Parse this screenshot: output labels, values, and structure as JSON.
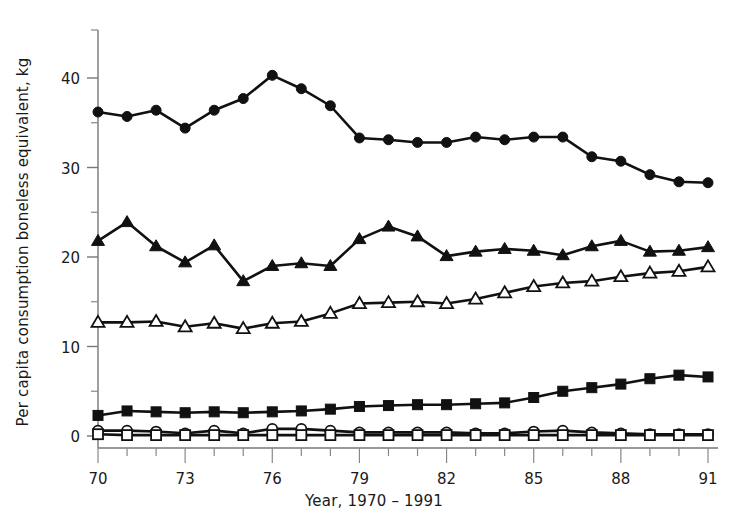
{
  "chart_data": {
    "type": "line",
    "title": "",
    "xlabel": "Year, 1970 – 1991",
    "ylabel": "Per capita consumption boneless equivalent, kg",
    "x": [
      70,
      71,
      72,
      73,
      74,
      75,
      76,
      77,
      78,
      79,
      80,
      81,
      82,
      83,
      84,
      85,
      86,
      87,
      88,
      89,
      90,
      91
    ],
    "xlim": [
      70,
      91
    ],
    "ylim": [
      0,
      44
    ],
    "ytick_labels": [
      "0",
      "10",
      "20",
      "30",
      "40"
    ],
    "ytick_values": [
      0,
      10,
      20,
      30,
      40
    ],
    "yminor_values": [
      5,
      15,
      25,
      35
    ],
    "xtick_labels": [
      "70",
      "73",
      "76",
      "79",
      "82",
      "85",
      "88",
      "91"
    ],
    "xtick_major_values": [
      70,
      73,
      76,
      79,
      82,
      85,
      88,
      91
    ],
    "grid": false,
    "legend": "none",
    "line_color": "#111111",
    "marker_fill_open": "#ffffff",
    "series": [
      {
        "name": "filled-circle-series",
        "marker": "filled-circle",
        "values": [
          36.2,
          35.7,
          36.4,
          34.4,
          36.4,
          37.7,
          40.3,
          38.8,
          36.9,
          33.3,
          33.1,
          32.8,
          32.8,
          33.4,
          33.1,
          33.4,
          33.4,
          31.2,
          30.7,
          29.2,
          28.4,
          28.3
        ]
      },
      {
        "name": "filled-triangle-series",
        "marker": "filled-triangle",
        "values": [
          21.8,
          23.9,
          21.2,
          19.4,
          21.3,
          17.3,
          19.0,
          19.3,
          19.0,
          22.0,
          23.4,
          22.3,
          20.1,
          20.6,
          20.9,
          20.7,
          20.2,
          21.2,
          21.8,
          20.6,
          20.7,
          21.1
        ]
      },
      {
        "name": "open-triangle-series",
        "marker": "open-triangle",
        "values": [
          12.7,
          12.7,
          12.8,
          12.2,
          12.6,
          12.0,
          12.6,
          12.8,
          13.7,
          14.8,
          14.9,
          15.0,
          14.8,
          15.3,
          16.0,
          16.7,
          17.1,
          17.3,
          17.8,
          18.2,
          18.4,
          18.9
        ]
      },
      {
        "name": "filled-square-series",
        "marker": "filled-square",
        "values": [
          2.3,
          2.8,
          2.7,
          2.6,
          2.7,
          2.6,
          2.7,
          2.8,
          3.0,
          3.3,
          3.4,
          3.5,
          3.5,
          3.6,
          3.7,
          4.3,
          5.0,
          5.4,
          5.8,
          6.4,
          6.8,
          6.6
        ]
      },
      {
        "name": "open-circle-series",
        "marker": "open-circle",
        "values": [
          0.6,
          0.6,
          0.5,
          0.3,
          0.6,
          0.3,
          0.8,
          0.8,
          0.6,
          0.4,
          0.4,
          0.4,
          0.4,
          0.3,
          0.3,
          0.5,
          0.6,
          0.4,
          0.3,
          0.2,
          0.2,
          0.2
        ]
      },
      {
        "name": "open-square-series",
        "marker": "open-square",
        "values": [
          0.2,
          0.1,
          0.1,
          0.1,
          0.1,
          0.1,
          0.1,
          0.1,
          0.1,
          0.1,
          0.1,
          0.1,
          0.1,
          0.1,
          0.1,
          0.1,
          0.1,
          0.1,
          0.1,
          0.1,
          0.1,
          0.1
        ]
      }
    ]
  }
}
